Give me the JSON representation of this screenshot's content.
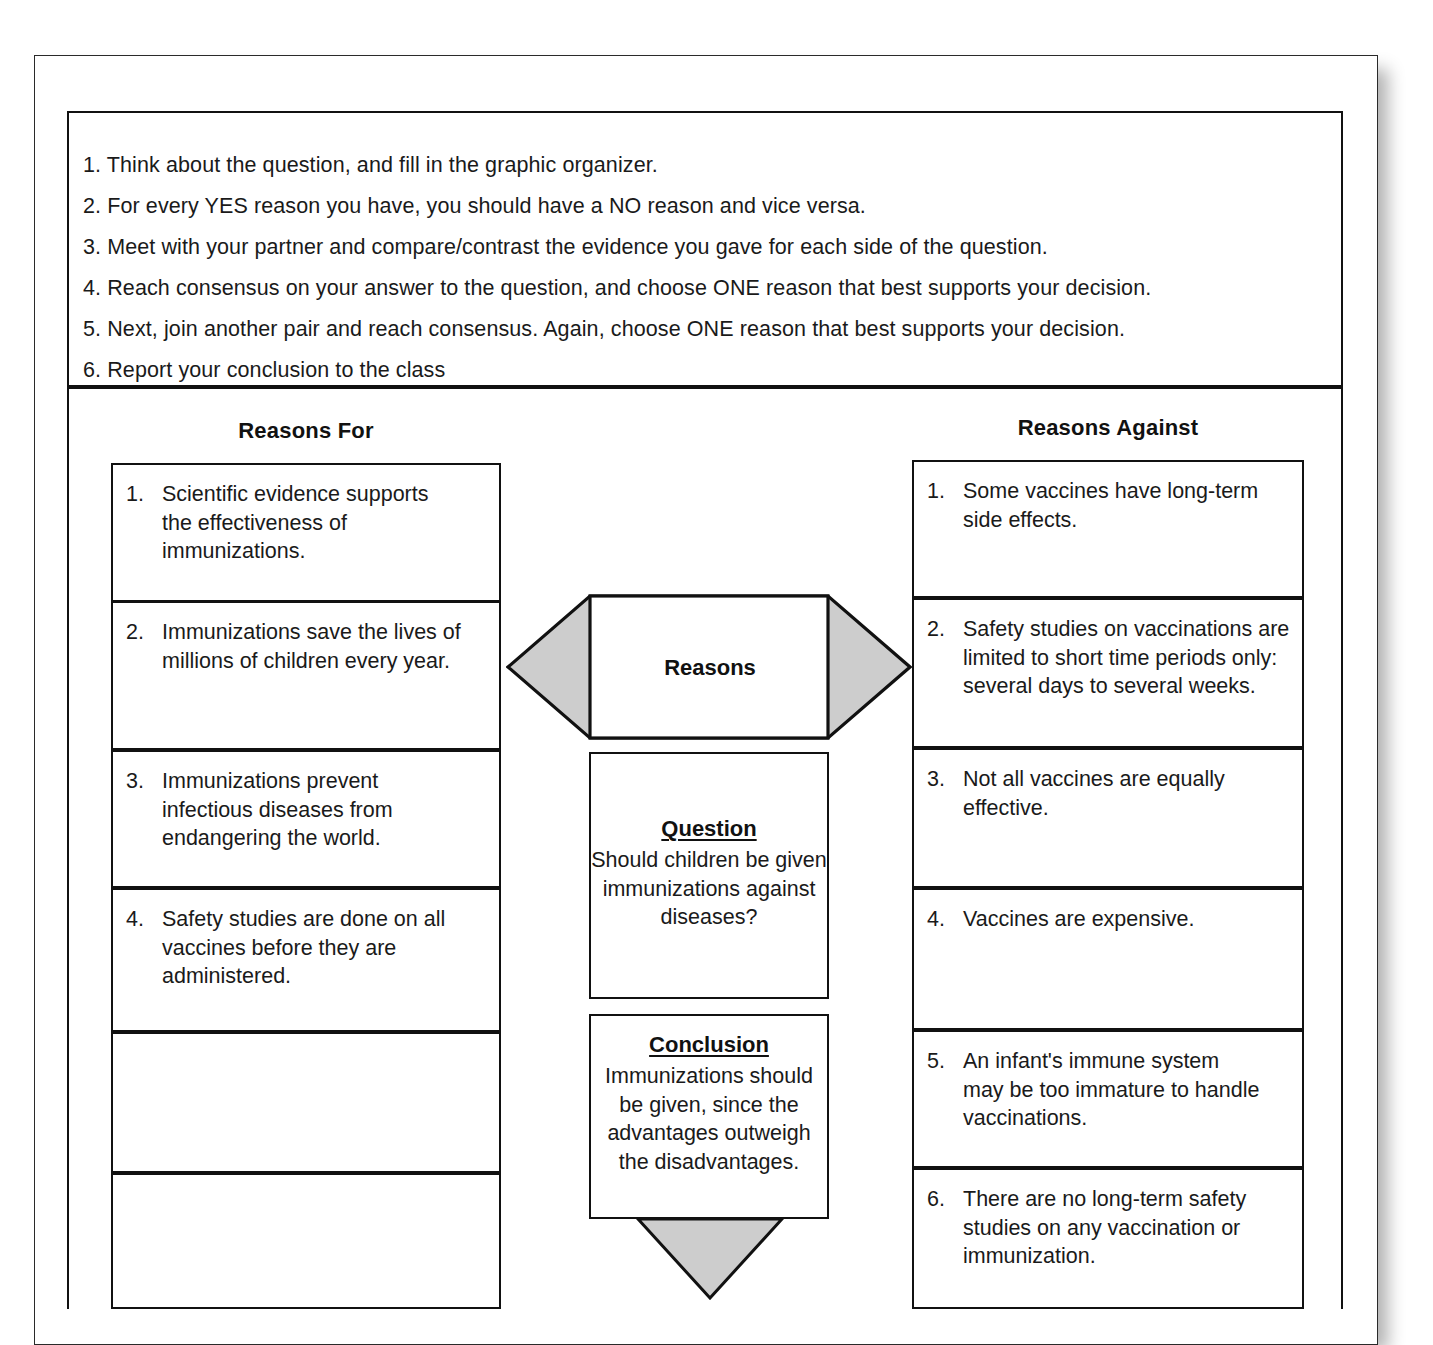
{
  "instructions": {
    "lines": [
      "1. Think about the question, and fill in the graphic organizer.",
      "2. For every YES reason you have, you should have a NO reason and vice versa.",
      "3. Meet with your partner and compare/contrast the evidence you gave for each side of the question.",
      "4. Reach consensus on your answer to the question, and choose ONE reason that best supports your decision.",
      "5. Next, join another pair and reach consensus. Again, choose ONE reason that best supports your decision.",
      "6. Report your conclusion to the class"
    ]
  },
  "organizer": {
    "left_heading": "Reasons For",
    "right_heading": "Reasons Against",
    "center": {
      "reasons_label": "Reasons",
      "question_title": "Question",
      "question_text": "Should children be given immunizations against diseases?",
      "conclusion_title": "Conclusion",
      "conclusion_text": "Immunizations should be given, since the advantages outweigh the disadvantages."
    },
    "reasons_for": [
      {
        "number": "1.",
        "text": "Scientific evidence supports the effectiveness of immunizations."
      },
      {
        "number": "2.",
        "text": "Immunizations save the lives of millions of children every year."
      },
      {
        "number": "3.",
        "text": "Immunizations prevent infectious diseases from endangering the world."
      },
      {
        "number": "4.",
        "text": "Safety studies are done on all vaccines before they are administered."
      },
      {
        "number": "",
        "text": ""
      },
      {
        "number": "",
        "text": ""
      }
    ],
    "reasons_against": [
      {
        "number": "1.",
        "text": "Some vaccines have long-term side effects."
      },
      {
        "number": "2.",
        "text": "Safety studies on vaccinations are limited to short time periods only: several days to several weeks."
      },
      {
        "number": "3.",
        "text": "Not all vaccines are equally effective."
      },
      {
        "number": "4.",
        "text": "Vaccines are expensive."
      },
      {
        "number": "5.",
        "text": "An infant's immune system may be too immature to handle vaccinations."
      },
      {
        "number": "6.",
        "text": "There are no long-term safety studies on any vaccination or immunization."
      }
    ]
  },
  "colors": {
    "arrow_fill": "#cdcdcd",
    "stroke": "#111111",
    "paper": "#ffffff"
  }
}
